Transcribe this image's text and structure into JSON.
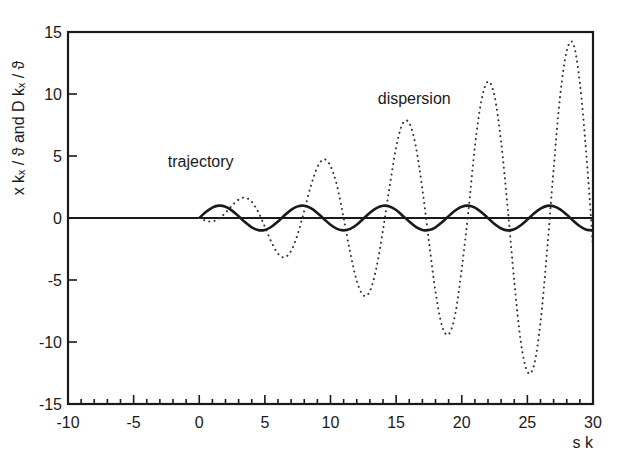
{
  "chart_data": {
    "type": "line",
    "title": "",
    "xlabel": "s k",
    "ylabel": "x kₓ / ϑ and D kₓ / ϑ",
    "xlim": [
      -10,
      30
    ],
    "ylim": [
      -15,
      15
    ],
    "xticks": [
      -10,
      -5,
      0,
      5,
      10,
      15,
      20,
      25,
      30
    ],
    "yticks": [
      -15,
      -10,
      -5,
      0,
      5,
      10,
      15
    ],
    "x_minor_step": 1,
    "grid": false,
    "legend": null,
    "annotations": [
      {
        "text": "trajectory",
        "x": -2.4,
        "y": 4.1
      },
      {
        "text": "dispersion",
        "x": 13.6,
        "y": 9.2
      }
    ],
    "zero_line": {
      "from": -10,
      "to": 30,
      "y": 0
    },
    "x": [
      0,
      0.5,
      1,
      1.5,
      2,
      2.5,
      3,
      3.5,
      4,
      4.5,
      5,
      5.5,
      6,
      6.5,
      7,
      7.5,
      8,
      8.5,
      9,
      9.5,
      10,
      10.5,
      11,
      11.5,
      12,
      12.5,
      13,
      13.5,
      14,
      14.5,
      15,
      15.5,
      16,
      16.5,
      17,
      17.5,
      18,
      18.5,
      19,
      19.5,
      20,
      20.5,
      21,
      21.5,
      22,
      22.5,
      23,
      23.5,
      24,
      24.5,
      25,
      25.5,
      26,
      26.5,
      27,
      27.5,
      28,
      28.5,
      29,
      29.5,
      30
    ],
    "series": [
      {
        "name": "trajectory",
        "style": "solid",
        "color": "#1a1a1a",
        "values": [
          0,
          0.479,
          0.841,
          0.997,
          0.909,
          0.598,
          0.141,
          -0.351,
          -0.757,
          -0.978,
          -0.959,
          -0.706,
          -0.279,
          0.215,
          0.657,
          0.938,
          0.989,
          0.798,
          0.412,
          -0.075,
          -0.544,
          -0.88,
          -1.0,
          -0.875,
          -0.537,
          -0.066,
          0.42,
          0.804,
          0.991,
          0.935,
          0.65,
          0.184,
          -0.288,
          -0.712,
          -0.961,
          -0.976,
          -0.751,
          -0.341,
          0.15,
          0.605,
          0.913,
          0.999,
          0.837,
          0.47,
          -0.009,
          -0.487,
          -0.846,
          -0.998,
          -0.906,
          -0.58,
          -0.132,
          0.36,
          0.763,
          0.98,
          0.956,
          0.695,
          0.271,
          -0.224,
          -0.664,
          -0.941,
          -0.988
        ]
      },
      {
        "name": "dispersion",
        "style": "dotted",
        "color": "#1a1a1a",
        "values": [
          0,
          -0.219,
          -0.27,
          -0.053,
          0.416,
          1.001,
          1.485,
          1.64,
          1.307,
          0.475,
          -0.709,
          -1.944,
          -2.881,
          -3.175,
          -2.639,
          -1.3,
          0.582,
          2.567,
          4.1,
          4.736,
          4.195,
          2.59,
          0.024,
          -2.781,
          -5.063,
          -6.236,
          -5.906,
          -4.009,
          -0.958,
          2.509,
          5.698,
          7.62,
          7.66,
          5.793,
          2.333,
          -1.881,
          -5.946,
          -8.705,
          -9.384,
          -7.768,
          -4.081,
          0.483,
          5.765,
          9.497,
          10.999,
          9.833,
          6.124,
          0.805,
          -5.077,
          -9.986,
          -12.391,
          -11.897,
          -8.41,
          -2.644,
          3.945,
          9.884,
          13.476,
          14.048,
          10.885,
          5.024,
          -2.314
        ]
      }
    ]
  },
  "labels": {
    "ylabel": "x kₓ / ϑ and D kₓ / ϑ",
    "xlabel": "s k",
    "trajectory": "trajectory",
    "dispersion": "dispersion"
  }
}
